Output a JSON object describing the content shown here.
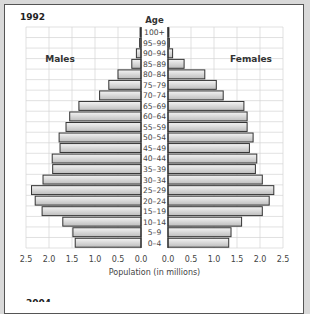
{
  "chart_data": {
    "type": "bar",
    "subtype": "population-pyramid",
    "title": "1992",
    "center_label": "Age",
    "xlabel": "Population (in millions)",
    "left_label": "Males",
    "right_label": "Females",
    "xlim": [
      0,
      2.5
    ],
    "x_ticks": [
      "2.5",
      "2.0",
      "1.5",
      "1.0",
      "0.5",
      "0.0"
    ],
    "x_ticks_right": [
      "0.0",
      "0.5",
      "1.0",
      "1.5",
      "2.0",
      "2.5"
    ],
    "grid": true,
    "categories": [
      "100+",
      "95–99",
      "90–94",
      "85–89",
      "80–84",
      "75–79",
      "70–74",
      "65–69",
      "60–64",
      "55–59",
      "50–54",
      "45–49",
      "40–44",
      "35–39",
      "30–34",
      "25–29",
      "20–24",
      "15–19",
      "10–14",
      "5–9",
      "0–4"
    ],
    "series": [
      {
        "name": "Males",
        "values": [
          0.02,
          0.03,
          0.1,
          0.2,
          0.5,
          0.7,
          0.9,
          1.35,
          1.55,
          1.63,
          1.78,
          1.76,
          1.93,
          1.92,
          2.13,
          2.38,
          2.3,
          2.15,
          1.7,
          1.48,
          1.43
        ]
      },
      {
        "name": "Females",
        "values": [
          0.02,
          0.03,
          0.1,
          0.35,
          0.8,
          1.05,
          1.2,
          1.65,
          1.72,
          1.72,
          1.85,
          1.77,
          1.93,
          1.9,
          2.05,
          2.3,
          2.2,
          2.05,
          1.6,
          1.37,
          1.32
        ]
      }
    ]
  },
  "next_chart_title_partial": "2004"
}
